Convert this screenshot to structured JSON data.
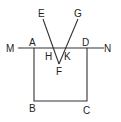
{
  "diagram": {
    "labels": {
      "M": "M",
      "A": "A",
      "H": "H",
      "K": "K",
      "D": "D",
      "N": "N",
      "E": "E",
      "G": "G",
      "F": "F",
      "B": "B",
      "C": "C"
    },
    "line_color": "#333333"
  }
}
